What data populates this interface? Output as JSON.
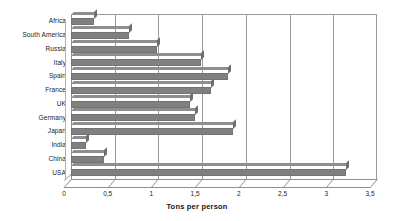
{
  "chart_data": {
    "type": "bar",
    "orientation": "horizontal",
    "title": "",
    "xlabel": "Tons per person",
    "ylabel": "",
    "xlim": [
      0,
      3.5
    ],
    "grid": true,
    "legend": "none",
    "decimal_separator": ",",
    "bar_color": "#808080",
    "categories": [
      "Africa",
      "South America",
      "Russia",
      "Italy",
      "Spain",
      "France",
      "UK",
      "Germany",
      "Japan",
      "India",
      "China",
      "USA"
    ],
    "values": [
      0.26,
      0.66,
      0.98,
      1.49,
      1.8,
      1.6,
      1.36,
      1.42,
      1.85,
      0.17,
      0.38,
      3.15
    ],
    "xticks": [
      0,
      0.5,
      1,
      1.5,
      2,
      2.5,
      3,
      3.5
    ],
    "xtick_labels": [
      "0",
      "0,5",
      "1",
      "1,5",
      "2",
      "2,5",
      "3",
      "3,5"
    ]
  }
}
